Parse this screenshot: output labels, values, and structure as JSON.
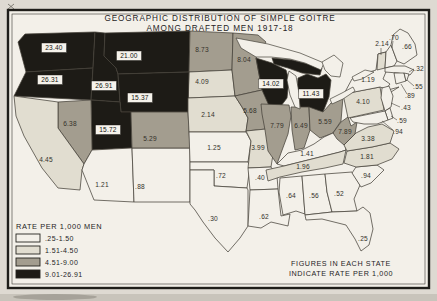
{
  "title": {
    "line1": "GEOGRAPHIC DISTRIBUTION OF SIMPLE GOITRE",
    "line2": "AMONG DRAFTED MEN 1917-18"
  },
  "legend": {
    "title": "RATE PER 1,000 MEN",
    "classes": [
      {
        "label": ".25-1.50",
        "color": "#f3f0e9"
      },
      {
        "label": "1.51-4.50",
        "color": "#e1ddd0"
      },
      {
        "label": "4.51-9.00",
        "color": "#a39d8f"
      },
      {
        "label": "9.01-26.91",
        "color": "#1d1b16"
      }
    ]
  },
  "note": {
    "line1": "FIGURES IN EACH STATE",
    "line2": "INDICATE RATE PER 1,000"
  },
  "map": {
    "unit": "rate per 1,000 men",
    "states": [
      {
        "abbr": "WA",
        "name": "Washington",
        "value": "23.40",
        "class": 4
      },
      {
        "abbr": "OR",
        "name": "Oregon",
        "value": "26.31",
        "class": 4
      },
      {
        "abbr": "ID",
        "name": "Idaho",
        "value": "26.91",
        "class": 4
      },
      {
        "abbr": "MT",
        "name": "Montana",
        "value": "21.00",
        "class": 4
      },
      {
        "abbr": "ND",
        "name": "North Dakota",
        "value": "8.73",
        "class": 3
      },
      {
        "abbr": "SD",
        "name": "South Dakota",
        "value": "4.09",
        "class": 2
      },
      {
        "abbr": "MN",
        "name": "Minnesota",
        "value": "8.04",
        "class": 3
      },
      {
        "abbr": "WI",
        "name": "Wisconsin",
        "value": "14.02",
        "class": 4
      },
      {
        "abbr": "MI",
        "name": "Michigan",
        "value": "11.43",
        "class": 4
      },
      {
        "abbr": "WY",
        "name": "Wyoming",
        "value": "15.37",
        "class": 4
      },
      {
        "abbr": "UT",
        "name": "Utah",
        "value": "15.72",
        "class": 4
      },
      {
        "abbr": "NV",
        "name": "Nevada",
        "value": "6.38",
        "class": 3
      },
      {
        "abbr": "CA",
        "name": "California",
        "value": "4.45",
        "class": 2
      },
      {
        "abbr": "AZ",
        "name": "Arizona",
        "value": "1.21",
        "class": 1
      },
      {
        "abbr": "NM",
        "name": "New Mexico",
        "value": ".88",
        "class": 1
      },
      {
        "abbr": "CO",
        "name": "Colorado",
        "value": "5.29",
        "class": 3
      },
      {
        "abbr": "NE",
        "name": "Nebraska",
        "value": "2.14",
        "class": 2
      },
      {
        "abbr": "KS",
        "name": "Kansas",
        "value": "1.25",
        "class": 1
      },
      {
        "abbr": "OK",
        "name": "Oklahoma",
        "value": ".72",
        "class": 1
      },
      {
        "abbr": "TX",
        "name": "Texas",
        "value": ".30",
        "class": 1
      },
      {
        "abbr": "IA",
        "name": "Iowa",
        "value": "5.68",
        "class": 3
      },
      {
        "abbr": "MO",
        "name": "Missouri",
        "value": "3.99",
        "class": 2
      },
      {
        "abbr": "AR",
        "name": "Arkansas",
        "value": ".40",
        "class": 1
      },
      {
        "abbr": "LA",
        "name": "Louisiana",
        "value": ".62",
        "class": 1
      },
      {
        "abbr": "IL",
        "name": "Illinois",
        "value": "7.79",
        "class": 3
      },
      {
        "abbr": "IN",
        "name": "Indiana",
        "value": "6.49",
        "class": 3
      },
      {
        "abbr": "OH",
        "name": "Ohio",
        "value": "5.59",
        "class": 3
      },
      {
        "abbr": "KY",
        "name": "Kentucky",
        "value": "1.41",
        "class": 1
      },
      {
        "abbr": "TN",
        "name": "Tennessee",
        "value": "1.96",
        "class": 2
      },
      {
        "abbr": "MS",
        "name": "Mississippi",
        "value": ".64",
        "class": 1
      },
      {
        "abbr": "AL",
        "name": "Alabama",
        "value": ".56",
        "class": 1
      },
      {
        "abbr": "GA",
        "name": "Georgia",
        "value": ".52",
        "class": 1
      },
      {
        "abbr": "FL",
        "name": "Florida",
        "value": ".25",
        "class": 1
      },
      {
        "abbr": "SC",
        "name": "South Carolina",
        "value": ".94",
        "class": 1
      },
      {
        "abbr": "NC",
        "name": "North Carolina",
        "value": "1.81",
        "class": 2
      },
      {
        "abbr": "VA",
        "name": "Virginia",
        "value": "3.38",
        "class": 2
      },
      {
        "abbr": "WV",
        "name": "West Virginia",
        "value": "7.89",
        "class": 3
      },
      {
        "abbr": "PA",
        "name": "Pennsylvania",
        "value": "4.10",
        "class": 2
      },
      {
        "abbr": "NY",
        "name": "New York",
        "value": "1.19",
        "class": 1
      },
      {
        "abbr": "NJ",
        "name": "New Jersey",
        "value": ".43",
        "class": 1
      },
      {
        "abbr": "DE",
        "name": "Delaware",
        "value": ".59",
        "class": 1
      },
      {
        "abbr": "MD",
        "name": "Maryland",
        "value": ".94",
        "class": 1
      },
      {
        "abbr": "VT",
        "name": "Vermont",
        "value": "2.14",
        "class": 2
      },
      {
        "abbr": "NH",
        "name": "New Hampshire",
        "value": ".70",
        "class": 1
      },
      {
        "abbr": "ME",
        "name": "Maine",
        "value": ".66",
        "class": 1
      },
      {
        "abbr": "MA",
        "name": "Massachusetts",
        "value": ".32",
        "class": 1
      },
      {
        "abbr": "RI",
        "name": "Rhode Island",
        "value": ".55",
        "class": 1
      },
      {
        "abbr": "CT",
        "name": "Connecticut",
        "value": ".89",
        "class": 1
      }
    ]
  }
}
